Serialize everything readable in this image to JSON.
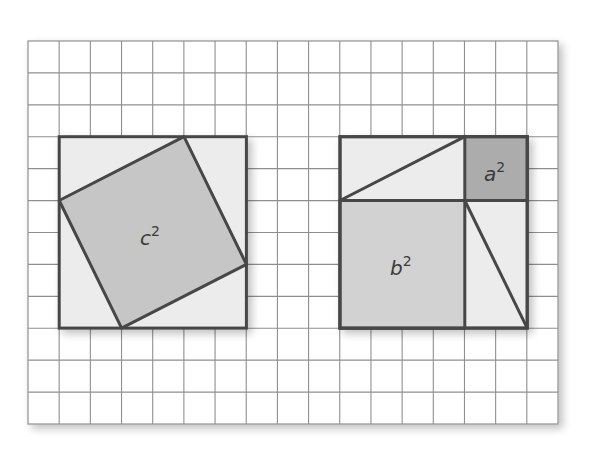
{
  "figure": {
    "grid": {
      "columns": 17,
      "rows": 12
    },
    "left_square": {
      "outer_size_units": 6,
      "inner_label_base": "c",
      "inner_label_exp": "2",
      "leg_a_units": 2,
      "leg_b_units": 4
    },
    "right_square": {
      "outer_size_units": 6,
      "small_square_label_base": "a",
      "small_square_label_exp": "2",
      "large_square_label_base": "b",
      "large_square_label_exp": "2"
    },
    "colors": {
      "background": "#ffffff",
      "grid_line": "#8f8f8f",
      "outline": "#474747",
      "triangle_fill": "#ececec",
      "c_square_fill": "#c6c6c6",
      "a_square_fill": "#acacac",
      "b_square_fill": "#d2d2d2"
    }
  }
}
